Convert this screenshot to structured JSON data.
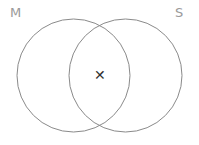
{
  "figure": {
    "type": "venn-diagram",
    "width": 199,
    "height": 145,
    "background_color": "#ffffff",
    "stroke_color": "#8a8a8a",
    "stroke_width": 1,
    "label_color": "#9a9a9a",
    "mark_color": "#333333"
  },
  "sets": [
    {
      "id": "left",
      "label": "M",
      "label_position": "top-left",
      "circle": {
        "cx": 73.5,
        "cy": 75.5,
        "r": 56.5
      }
    },
    {
      "id": "right",
      "label": "S",
      "label_position": "top-right",
      "circle": {
        "cx": 125.5,
        "cy": 75.5,
        "r": 56.5
      }
    }
  ],
  "marks": [
    {
      "id": "intersection-element",
      "glyph": "✕",
      "region": "intersection",
      "x": 100,
      "y": 75
    }
  ],
  "regions": {
    "left_only": "M only",
    "right_only": "S only",
    "intersection": "M and S"
  }
}
